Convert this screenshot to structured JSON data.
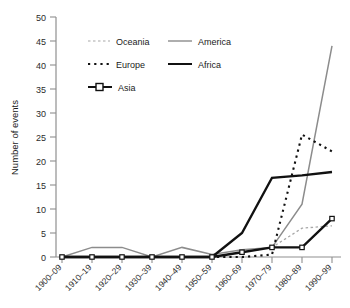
{
  "chart_data": {
    "type": "line",
    "title": "",
    "xlabel": "",
    "ylabel": "Number of events",
    "ylim": [
      0,
      50
    ],
    "ytick_step": 5,
    "yticks": [
      0,
      5,
      10,
      15,
      20,
      25,
      30,
      35,
      40,
      45,
      50
    ],
    "grid": false,
    "legend_position": "upper-left-inside",
    "categories": [
      "1900–09",
      "1910–19",
      "1920–29",
      "1930–39",
      "1940–49",
      "1950–59",
      "1960–69",
      "1970–79",
      "1980–89",
      "1990–99"
    ],
    "series": [
      {
        "name": "Oceania",
        "style": "dotted",
        "color": "#a8a8a8",
        "values": [
          0,
          0,
          0,
          0,
          0,
          0,
          1,
          2,
          6,
          6.5
        ]
      },
      {
        "name": "America",
        "style": "solid",
        "color": "#8c8c8c",
        "values": [
          0,
          2,
          2,
          0,
          2,
          0.5,
          1.5,
          2,
          11,
          44
        ]
      },
      {
        "name": "Europe",
        "style": "dotted-bold",
        "color": "#111111",
        "values": [
          0,
          0,
          0,
          0,
          0,
          0,
          0,
          0.5,
          25.5,
          22
        ]
      },
      {
        "name": "Africa",
        "style": "solid-bold",
        "color": "#111111",
        "values": [
          0,
          0,
          0,
          0,
          0,
          0,
          5,
          16.5,
          17,
          17.7
        ]
      },
      {
        "name": "Asia",
        "style": "solid-bold-marker",
        "color": "#111111",
        "values": [
          0,
          0,
          0,
          0,
          0,
          0,
          1,
          2,
          2,
          8
        ]
      }
    ]
  },
  "legend": {
    "entries": [
      {
        "label": "Oceania"
      },
      {
        "label": "America"
      },
      {
        "label": "Europe"
      },
      {
        "label": "Africa"
      },
      {
        "label": "Asia"
      }
    ]
  },
  "axis": {
    "y_title": "Number of events"
  }
}
